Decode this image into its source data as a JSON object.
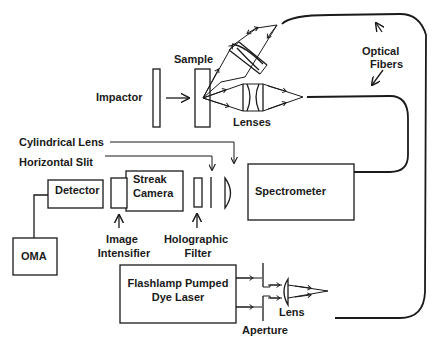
{
  "diagram": {
    "type": "experimental-setup",
    "colors": {
      "line": "#1a1a1a",
      "background": "#ffffff"
    },
    "labels": {
      "impactor": "Impactor",
      "sample": "Sample",
      "lenses": "Lenses",
      "optical_fibers_1": "Optical",
      "optical_fibers_2": "Fibers",
      "cylindrical_lens": "Cylindrical Lens",
      "horizontal_slit": "Horizontal Slit",
      "detector": "Detector",
      "streak_camera_1": "Streak",
      "streak_camera_2": "Camera",
      "spectrometer": "Spectrometer",
      "oma": "OMA",
      "image_intensifier_1": "Image",
      "image_intensifier_2": "Intensifier",
      "holographic_filter_1": "Holographic",
      "holographic_filter_2": "Filter",
      "dye_laser_1": "Flashlamp Pumped",
      "dye_laser_2": "Dye Laser",
      "lens": "Lens",
      "aperture": "Aperture"
    }
  }
}
